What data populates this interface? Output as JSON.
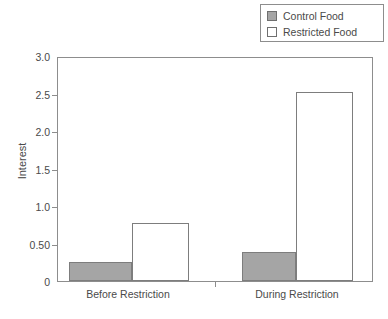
{
  "chart_data": {
    "type": "bar",
    "title": "",
    "xlabel": "",
    "ylabel": "Interest",
    "categories": [
      "Before Restriction",
      "During Restriction"
    ],
    "series": [
      {
        "name": "Control Food",
        "color": "#a5a5a5",
        "values": [
          0.26,
          0.39
        ]
      },
      {
        "name": "Restricted Food",
        "color": "#ffffff",
        "values": [
          0.78,
          2.52
        ]
      }
    ],
    "ylim": [
      0,
      3.0
    ],
    "yticks": [
      0,
      0.5,
      1.0,
      1.5,
      2.0,
      2.5,
      3.0
    ],
    "ytick_labels": [
      "0",
      "0.50",
      "1.0",
      "1.5",
      "2.0",
      "2.5",
      "3.0"
    ],
    "grid": false,
    "legend_position": "top-right",
    "frame": true
  },
  "legend": {
    "items": [
      {
        "label": "Control Food",
        "swatch": "control-swatch"
      },
      {
        "label": "Restricted Food",
        "swatch": "restricted-swatch"
      }
    ]
  },
  "axes": {
    "y_title": "Interest"
  }
}
